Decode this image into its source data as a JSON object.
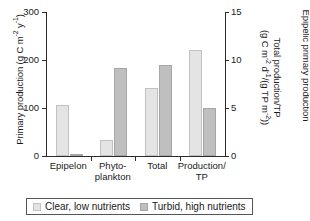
{
  "chart_data": {
    "type": "bar",
    "title": "",
    "categories": [
      "Epipelon",
      "Phyto-\nplankton",
      "Total",
      "Production/\nTP"
    ],
    "series": [
      {
        "name": "Clear, low nutrients",
        "values": [
          107,
          33,
          141,
          11
        ],
        "color": "#e4e4e4"
      },
      {
        "name": "Turbid, high nutrients",
        "values": [
          5,
          183,
          190,
          5
        ],
        "color": "#bfbfbf"
      }
    ],
    "axis_assignment": [
      "left",
      "left",
      "left",
      "right"
    ],
    "xlabel": "",
    "ylabel": "Primary production (g C m-2 y-1)",
    "ylabel_right": "Total production/TP (g C m-2 d-1/(g TP m-2))",
    "ylim": [
      0,
      300
    ],
    "ylim_right": [
      0,
      15
    ],
    "yticks": [
      0,
      100,
      200,
      300
    ],
    "yticks_right": [
      0,
      5,
      10,
      15
    ],
    "grid": false,
    "legend_position": "bottom"
  },
  "axes": {
    "left": {
      "title_parts": {
        "main": "Primary production (g C m",
        "sup1": "-2",
        "mid": " y",
        "sup2": "-1",
        "end": ")"
      },
      "ticks": [
        {
          "label": "300",
          "value": 300
        },
        {
          "label": "200",
          "value": 200
        },
        {
          "label": "100",
          "value": 100
        },
        {
          "label": "0",
          "value": 0
        }
      ]
    },
    "right": {
      "title_parts": {
        "l1": "Total production/TP",
        "l2_a": "(g C m",
        "l2_sup1": "-2",
        "l2_b": " d",
        "l2_sup2": "-1",
        "l2_c": "/(g TP m",
        "l2_sup3": "-2",
        "l2_d": "))"
      },
      "ticks": [
        {
          "label": "15",
          "value": 15
        },
        {
          "label": "10",
          "value": 10
        },
        {
          "label": "5",
          "value": 5
        },
        {
          "label": "0",
          "value": 0
        }
      ]
    },
    "far_right": {
      "title": "Epipelic primary production"
    }
  },
  "categories": [
    {
      "label": "Epipelon"
    },
    {
      "label": "Phyto-\nplankton"
    },
    {
      "label": "Total"
    },
    {
      "label": "Production/\nTP"
    }
  ],
  "legend": {
    "items": [
      {
        "label": "Clear, low nutrients"
      },
      {
        "label": "Turbid, high nutrients"
      }
    ]
  }
}
